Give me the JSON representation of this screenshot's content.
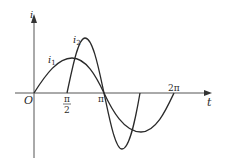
{
  "diagram": {
    "axes": {
      "x_label": "t",
      "y_label": "i",
      "origin_label": "O",
      "ticks": [
        {
          "label_num": "π",
          "label_den": "2",
          "value": "π/2"
        },
        {
          "label": "π",
          "value": "π"
        },
        {
          "label": "2π",
          "value": "2π"
        }
      ]
    },
    "curves": [
      {
        "name": "i1",
        "label_main": "i",
        "label_sub": "1",
        "description": "sine wave from 0 to 2π, smaller amplitude"
      },
      {
        "name": "i2",
        "label_main": "i",
        "label_sub": "2",
        "description": "sine wave from π/2 to 3π/2, larger amplitude"
      }
    ],
    "colors": {
      "line": "#2a2a2a",
      "background": "#ffffff"
    }
  }
}
